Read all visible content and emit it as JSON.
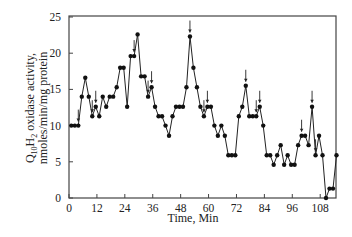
{
  "chart_data": {
    "type": "line",
    "title": "",
    "xlabel": "Time, Min",
    "ylabel_line1": "Q10H2 oxidase activity,",
    "ylabel_line2": "nmoles/min/mg protein",
    "xlim": [
      0,
      118
    ],
    "ylim": [
      0,
      25
    ],
    "x_ticks": [
      0,
      12,
      24,
      36,
      48,
      60,
      72,
      84,
      96,
      108
    ],
    "y_ticks": [
      0,
      5,
      10,
      15,
      20,
      25
    ],
    "grid": false,
    "legend": null,
    "marker": "filled-circle",
    "line_color": "#222222",
    "series": [
      {
        "name": "Q10H2 oxidase activity",
        "x": [
          1,
          2.5,
          4,
          5.5,
          7,
          8.5,
          10,
          11.5,
          13,
          14.5,
          16,
          17.5,
          19,
          20.5,
          22,
          23.5,
          25,
          26.5,
          28,
          29.5,
          31,
          32.5,
          34,
          35.5,
          37,
          38.5,
          40,
          41.5,
          43,
          44.5,
          46,
          47.5,
          49,
          50.5,
          52,
          53.5,
          55,
          56.5,
          58,
          59.5,
          61,
          62.5,
          64,
          65.5,
          67,
          68.5,
          70,
          71.5,
          73,
          74.5,
          76,
          77.5,
          79,
          80.5,
          82,
          83.5,
          85,
          86.5,
          88,
          89.5,
          91,
          92.5,
          94,
          95.5,
          97,
          98.5,
          100,
          101.5,
          103,
          104.5,
          106,
          107.5,
          109,
          110.5,
          112,
          113.5,
          115
        ],
        "values": [
          10,
          10,
          10,
          14,
          16.6,
          14,
          11.3,
          12.6,
          11.3,
          14,
          12.6,
          14,
          14,
          15.3,
          18,
          18,
          12.6,
          19.6,
          19.6,
          22.6,
          16.8,
          16.8,
          14,
          15.3,
          12.6,
          11.3,
          11.3,
          10,
          8.6,
          11.3,
          12.6,
          12.6,
          12.6,
          15.3,
          22.3,
          18,
          15.3,
          12.6,
          11.3,
          12.6,
          12.6,
          10,
          8.6,
          10,
          8.6,
          5.9,
          5.9,
          5.9,
          11.3,
          12.6,
          15.5,
          11.3,
          11.3,
          11.3,
          12.6,
          10,
          5.9,
          5.9,
          4.6,
          5.9,
          7.3,
          4.6,
          5.9,
          4.6,
          4.6,
          7.3,
          8.6,
          8.6,
          7.3,
          12.6,
          5.9,
          8.6,
          5.9,
          0,
          1.3,
          1.3,
          5.9
        ],
        "arrow_markers_at": [
          4,
          10,
          11.5,
          28,
          34,
          35.5,
          52,
          58,
          59.5,
          76,
          80.5,
          82,
          100,
          104.5,
          106
        ],
        "arrow_style": "downward arrows marking peaks (single or double)"
      }
    ]
  }
}
